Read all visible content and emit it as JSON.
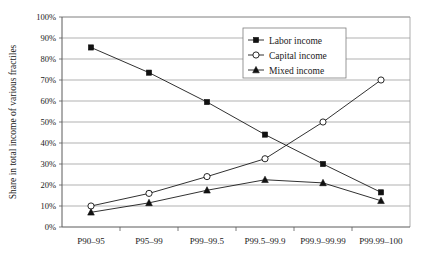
{
  "chart_data": {
    "type": "line",
    "title": "",
    "xlabel": "",
    "ylabel": "Share in total income of various fractiles",
    "categories": [
      "P90–95",
      "P95–99",
      "P99–99.5",
      "P99.5–99.9",
      "P99.9–99.99",
      "P99.99–100"
    ],
    "ylim": [
      0,
      100
    ],
    "ytick_labels": [
      "100%",
      "90%",
      "80%",
      "70%",
      "60%",
      "50%",
      "40%",
      "30%",
      "20%",
      "10%",
      "0%"
    ],
    "ytick_values": [
      100,
      90,
      80,
      70,
      60,
      50,
      40,
      30,
      20,
      10,
      0
    ],
    "grid": true,
    "legend_position": "top-right",
    "series": [
      {
        "name": "Labor income",
        "marker": "filled-square",
        "values": [
          85.5,
          73.5,
          59.5,
          44.0,
          30.0,
          16.5
        ]
      },
      {
        "name": "Capital income",
        "marker": "open-circle",
        "values": [
          10.0,
          16.0,
          24.0,
          32.5,
          50.0,
          70.0
        ]
      },
      {
        "name": "Mixed income",
        "marker": "filled-triangle",
        "values": [
          7.0,
          11.5,
          17.5,
          22.5,
          21.0,
          12.5
        ]
      }
    ]
  },
  "legend": {
    "entries": [
      {
        "label": "Labor income"
      },
      {
        "label": "Capital income"
      },
      {
        "label": "Mixed income"
      }
    ]
  },
  "colors": {
    "background": "#ffffff",
    "ink": "#1a1a1a",
    "grid": "#8f8f8f",
    "frame": "#9a9a9a"
  }
}
